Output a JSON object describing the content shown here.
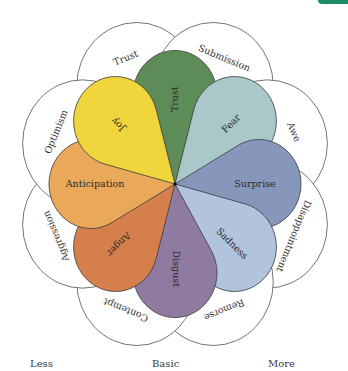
{
  "colors": {
    "corner_tab": "#1f8a6a",
    "outline": "#555555"
  },
  "petals": [
    {
      "label": "Trust",
      "angle": 90,
      "color": "#5e8c58"
    },
    {
      "label": "Fear",
      "angle": 45,
      "color": "#a9c8c9"
    },
    {
      "label": "Surprise",
      "angle": 0,
      "color": "#8797bc"
    },
    {
      "label": "Sadness",
      "angle": -45,
      "color": "#b2c4dd"
    },
    {
      "label": "Disgust",
      "angle": -90,
      "color": "#8f7ba0"
    },
    {
      "label": "Anger",
      "angle": -135,
      "color": "#d47f4c"
    },
    {
      "label": "Anticipation",
      "angle": 180,
      "color": "#eaa85a"
    },
    {
      "label": "Joy",
      "angle": 135,
      "color": "#f0d53c"
    }
  ],
  "dyads": [
    {
      "label": "Trust",
      "angle": 112.5
    },
    {
      "label": "Submission",
      "angle": 67.5
    },
    {
      "label": "Awe",
      "angle": 22.5
    },
    {
      "label": "Disappointment",
      "angle": -22.5
    },
    {
      "label": "Remorse",
      "angle": -67.5
    },
    {
      "label": "Contempt",
      "angle": -112.5
    },
    {
      "label": "Aggression",
      "angle": -157.5
    },
    {
      "label": "Optimism",
      "angle": 157.5
    }
  ],
  "legend": {
    "less": "Less",
    "basic": "Basic",
    "more": "More"
  }
}
